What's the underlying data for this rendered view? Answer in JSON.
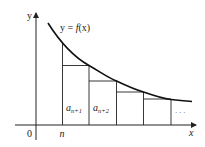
{
  "diagram": {
    "type": "integral-test-rectangles",
    "axes": {
      "x_label": "x",
      "y_label": "y",
      "origin_label": "0"
    },
    "curve_label": "y = f(x)",
    "curve_label_parts": {
      "lhs": "y = ",
      "func": "f",
      "arg": "(x)"
    },
    "x_tick_label": "n",
    "rectangle_labels": [
      {
        "base": "a",
        "sub": "n+1"
      },
      {
        "base": "a",
        "sub": "n+2"
      }
    ],
    "ellipsis": "· · ·",
    "colors": {
      "stroke": "#222222",
      "curve": "#111111",
      "background": "#ffffff"
    }
  }
}
